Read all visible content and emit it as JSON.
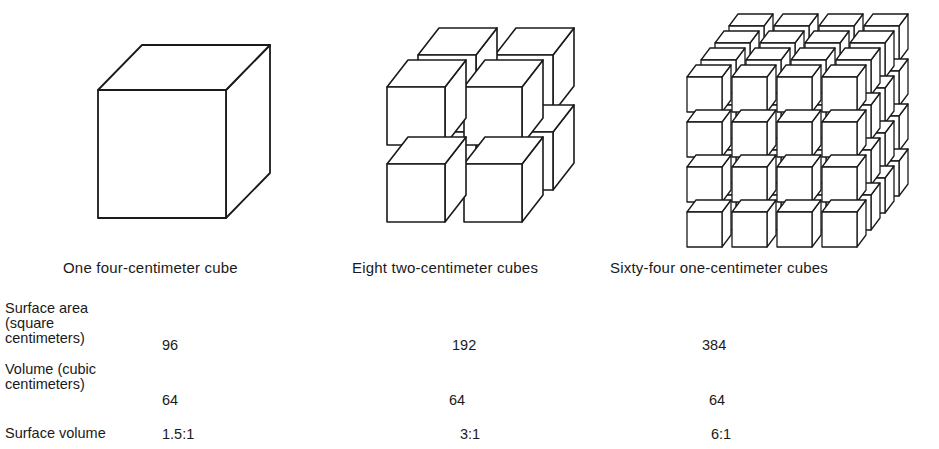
{
  "figure": {
    "groups": [
      {
        "caption": "One four-centimeter cube",
        "cube_count": 1,
        "edge_cm": 4,
        "arrangement": "1x1x1"
      },
      {
        "caption": "Eight two-centimeter cubes",
        "cube_count": 8,
        "edge_cm": 2,
        "arrangement": "2x2x2"
      },
      {
        "caption": "Sixty-four one-centimeter cubes",
        "cube_count": 64,
        "edge_cm": 1,
        "arrangement": "4x4x4"
      }
    ]
  },
  "table": {
    "rows": [
      {
        "label_lines": [
          "Surface area",
          "(square",
          "centimeters)"
        ],
        "values": [
          "96",
          "192",
          "384"
        ]
      },
      {
        "label_lines": [
          "Volume (cubic",
          "centimeters)"
        ],
        "values": [
          "64",
          "64",
          "64"
        ]
      },
      {
        "label_lines": [
          "Surface volume"
        ],
        "values": [
          "1.5:1",
          "3:1",
          "6:1"
        ]
      }
    ]
  },
  "colors": {
    "stroke": "#1a1a1a",
    "face": "#ffffff",
    "background": "#ffffff"
  }
}
